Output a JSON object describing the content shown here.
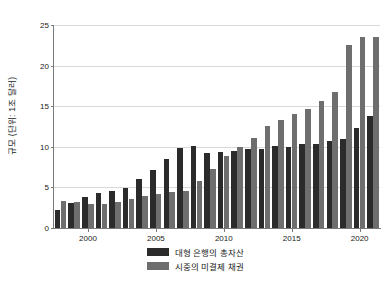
{
  "chart_data": {
    "type": "bar",
    "title": "",
    "subtitle": "",
    "xlabel": "",
    "ylabel": "규모 (단위: 1조 달러)",
    "ylim": [
      0,
      25
    ],
    "ytick_values": [
      0,
      5,
      10,
      15,
      20,
      25
    ],
    "ytick_labels": [
      "0",
      "5",
      "10",
      "15",
      "20",
      "25"
    ],
    "xtick_labels": [
      "2000",
      "2005",
      "2010",
      "2015",
      "2020"
    ],
    "xtick_years": [
      2000,
      2005,
      2010,
      2015,
      2020
    ],
    "grid": true,
    "legend_position": "bottom",
    "categories": [
      "1998",
      "1999",
      "2000",
      "2001",
      "2002",
      "2003",
      "2004",
      "2005",
      "2006",
      "2007",
      "2008",
      "2009",
      "2010",
      "2011",
      "2012",
      "2013",
      "2014",
      "2015",
      "2016",
      "2017",
      "2018",
      "2019",
      "2020",
      "2021"
    ],
    "series": [
      {
        "name": "대형 은행의 총자산",
        "color": "#2b2b2b",
        "values": [
          2.2,
          3.1,
          3.8,
          4.3,
          4.5,
          4.9,
          6.0,
          7.2,
          8.5,
          9.8,
          10.1,
          9.2,
          9.3,
          9.5,
          9.7,
          9.7,
          10.1,
          10.0,
          10.3,
          10.4,
          10.7,
          11.0,
          12.3,
          13.8
        ]
      },
      {
        "name": "시중의 미결제 채권",
        "color": "#6e6e6e",
        "values": [
          3.3,
          3.2,
          2.9,
          2.9,
          3.2,
          3.6,
          4.0,
          4.2,
          4.4,
          4.6,
          5.8,
          7.3,
          8.9,
          10.0,
          11.1,
          12.6,
          13.3,
          14.1,
          14.6,
          15.7,
          16.8,
          22.5,
          23.5,
          23.5
        ]
      }
    ]
  },
  "legend": {
    "items": [
      {
        "label": "대형 은행의 총자산",
        "color": "#2b2b2b"
      },
      {
        "label": "시중의 미결제 채권",
        "color": "#6e6e6e"
      }
    ]
  }
}
